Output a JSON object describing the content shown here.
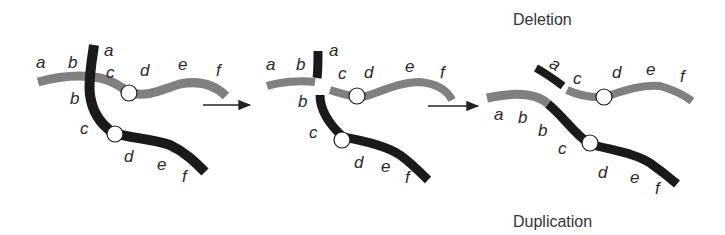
{
  "diagram": {
    "titles": {
      "deletion": "Deletion",
      "duplication": "Duplication"
    },
    "colors": {
      "gray_chromatid": "#808080",
      "black_chromatid": "#1a1a1a",
      "centromere_fill": "#ffffff",
      "arrow": "#222222",
      "text": "#2a2a2a"
    },
    "panel1": {
      "gray_labels": [
        "a",
        "b",
        "c",
        "d",
        "e",
        "f"
      ],
      "black_labels": [
        "a",
        "b",
        "c",
        "d",
        "e",
        "f"
      ]
    },
    "panel2": {
      "gray_labels": [
        "a",
        "b",
        "c",
        "d",
        "e",
        "f"
      ],
      "black_labels": [
        "a",
        "b",
        "c",
        "d",
        "e",
        "f"
      ]
    },
    "panel3": {
      "deletion_labels": [
        "a",
        "c",
        "d",
        "e",
        "f"
      ],
      "duplication_labels": [
        "a",
        "b",
        "b",
        "c",
        "d",
        "e",
        "f"
      ]
    }
  }
}
